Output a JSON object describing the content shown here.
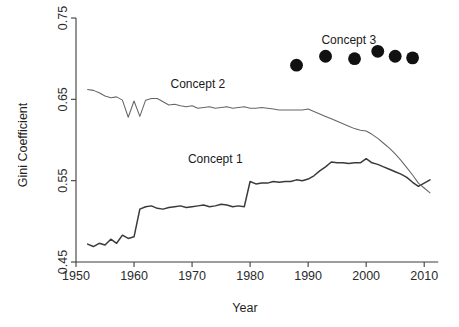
{
  "chart_data": {
    "type": "line",
    "title": "",
    "xlabel": "Year",
    "ylabel": "Gini Coefficient",
    "xlim": [
      1950,
      2011
    ],
    "ylim": [
      0.45,
      0.75
    ],
    "xticks": [
      1950,
      1960,
      1970,
      1980,
      1990,
      2000,
      2010
    ],
    "xtick_labels": [
      "1950",
      "1960",
      "1970",
      "1980",
      "1990",
      "2000",
      "2010"
    ],
    "yticks": [
      0.45,
      0.55,
      0.65,
      0.75
    ],
    "ytick_labels": [
      "0.45",
      "0.55",
      "0.65",
      "0.75"
    ],
    "grid": false,
    "legend_position": "inline-annotations",
    "series": [
      {
        "name": "Concept 1",
        "type": "line",
        "label_x": 1974,
        "label_y": 0.572,
        "color": "#3a3a3a",
        "x": [
          1952,
          1953,
          1954,
          1955,
          1956,
          1957,
          1958,
          1959,
          1960,
          1961,
          1962,
          1963,
          1964,
          1965,
          1966,
          1967,
          1968,
          1969,
          1970,
          1971,
          1972,
          1973,
          1974,
          1975,
          1976,
          1977,
          1978,
          1979,
          1980,
          1981,
          1982,
          1983,
          1984,
          1985,
          1986,
          1987,
          1988,
          1989,
          1990,
          1991,
          1992,
          1993,
          1994,
          1995,
          1996,
          1997,
          1998,
          1999,
          2000,
          2001,
          2002,
          2003,
          2004,
          2005,
          2006,
          2007,
          2008,
          2009,
          2010,
          2011
        ],
        "values": [
          0.472,
          0.469,
          0.473,
          0.471,
          0.478,
          0.473,
          0.483,
          0.479,
          0.481,
          0.515,
          0.518,
          0.519,
          0.516,
          0.515,
          0.517,
          0.518,
          0.519,
          0.517,
          0.518,
          0.519,
          0.52,
          0.518,
          0.519,
          0.521,
          0.52,
          0.518,
          0.519,
          0.518,
          0.549,
          0.546,
          0.547,
          0.547,
          0.549,
          0.548,
          0.549,
          0.549,
          0.551,
          0.55,
          0.552,
          0.556,
          0.562,
          0.567,
          0.573,
          0.572,
          0.572,
          0.571,
          0.572,
          0.572,
          0.577,
          0.572,
          0.57,
          0.567,
          0.564,
          0.561,
          0.558,
          0.554,
          0.548,
          0.543,
          0.547,
          0.551
        ]
      },
      {
        "name": "Concept 2",
        "type": "line",
        "label_x": 1971,
        "label_y": 0.664,
        "color": "#666666",
        "x": [
          1952,
          1953,
          1954,
          1955,
          1956,
          1957,
          1958,
          1959,
          1960,
          1961,
          1962,
          1963,
          1964,
          1965,
          1966,
          1967,
          1968,
          1969,
          1970,
          1971,
          1972,
          1973,
          1974,
          1975,
          1976,
          1977,
          1978,
          1979,
          1980,
          1981,
          1982,
          1983,
          1984,
          1985,
          1986,
          1987,
          1988,
          1989,
          1990,
          1991,
          1992,
          1993,
          1994,
          1995,
          1996,
          1997,
          1998,
          1999,
          2000,
          2001,
          2002,
          2003,
          2004,
          2005,
          2006,
          2007,
          2008,
          2009,
          2010,
          2011
        ],
        "values": [
          0.662,
          0.661,
          0.658,
          0.654,
          0.652,
          0.653,
          0.649,
          0.628,
          0.648,
          0.629,
          0.649,
          0.651,
          0.651,
          0.647,
          0.643,
          0.644,
          0.642,
          0.641,
          0.642,
          0.639,
          0.64,
          0.641,
          0.639,
          0.64,
          0.641,
          0.639,
          0.64,
          0.641,
          0.639,
          0.639,
          0.64,
          0.639,
          0.638,
          0.637,
          0.637,
          0.637,
          0.637,
          0.637,
          0.638,
          0.635,
          0.632,
          0.629,
          0.626,
          0.623,
          0.62,
          0.617,
          0.614,
          0.612,
          0.611,
          0.607,
          0.602,
          0.596,
          0.59,
          0.583,
          0.575,
          0.566,
          0.557,
          0.547,
          0.541,
          0.535
        ]
      },
      {
        "name": "Concept 3",
        "type": "scatter",
        "label_x": 1997,
        "label_y": 0.718,
        "color": "#111111",
        "marker": "filled-circle",
        "x": [
          1988,
          1993,
          1998,
          2002,
          2005,
          2008
        ],
        "values": [
          0.692,
          0.703,
          0.7,
          0.709,
          0.703,
          0.701
        ]
      }
    ]
  },
  "annotations": {
    "concept1_label": "Concept 1",
    "concept2_label": "Concept 2",
    "concept3_label": "Concept 3"
  }
}
